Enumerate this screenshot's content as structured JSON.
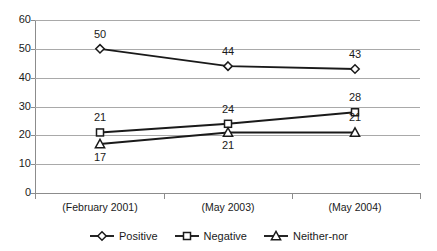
{
  "chart_data": {
    "type": "line",
    "title": "",
    "subtitle": "",
    "xlabel": "",
    "ylabel": "",
    "categories": [
      "(February 2001)",
      "(May 2003)",
      "(May 2004)"
    ],
    "series": [
      {
        "name": "Positive",
        "marker": "diamond",
        "values": [
          50,
          44,
          43
        ]
      },
      {
        "name": "Negative",
        "marker": "square",
        "values": [
          21,
          24,
          28
        ]
      },
      {
        "name": "Neither-nor",
        "marker": "triangle",
        "values": [
          17,
          21,
          21
        ]
      }
    ],
    "ylim": [
      0,
      60
    ],
    "ytick_labels": [
      "60",
      "50",
      "40",
      "30",
      "20",
      "10",
      "0"
    ],
    "ytick_values": [
      60,
      50,
      40,
      30,
      20,
      10,
      0
    ],
    "grid": true,
    "legend_position": "bottom",
    "colors": {
      "line": "#1a1a1a",
      "marker_fill": "#ffffff",
      "gridline": "#a9a9a9",
      "axis": "#8c8c8c",
      "text": "#1a1a1a",
      "background": "#ffffff"
    },
    "point_labels": [
      {
        "series": "Positive",
        "category": "(February 2001)",
        "text": "50",
        "placement": "above"
      },
      {
        "series": "Positive",
        "category": "(May 2003)",
        "text": "44",
        "placement": "above"
      },
      {
        "series": "Positive",
        "category": "(May 2004)",
        "text": "43",
        "placement": "above"
      },
      {
        "series": "Negative",
        "category": "(February 2001)",
        "text": "21",
        "placement": "above"
      },
      {
        "series": "Negative",
        "category": "(May 2003)",
        "text": "24",
        "placement": "above"
      },
      {
        "series": "Negative",
        "category": "(May 2004)",
        "text": "28",
        "placement": "above"
      },
      {
        "series": "Neither-nor",
        "category": "(February 2001)",
        "text": "17",
        "placement": "below"
      },
      {
        "series": "Neither-nor",
        "category": "(May 2003)",
        "text": "21",
        "placement": "below"
      },
      {
        "series": "Neither-nor",
        "category": "(May 2004)",
        "text": "21",
        "placement": "above"
      }
    ]
  },
  "legend": {
    "items": [
      {
        "label": "Positive",
        "marker": "diamond-marker-icon"
      },
      {
        "label": "Negative",
        "marker": "square-marker-icon"
      },
      {
        "label": "Neither-nor",
        "marker": "triangle-marker-icon"
      }
    ]
  }
}
